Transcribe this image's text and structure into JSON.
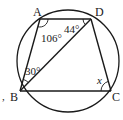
{
  "diagram": {
    "type": "cyclic-quadrilateral",
    "colors": {
      "stroke": "#1a1a1a",
      "background": "#ffffff"
    },
    "circle": {
      "cx": 68,
      "cy": 61,
      "r": 51
    },
    "vertices": {
      "A": {
        "label": "A",
        "x": 40,
        "y": 19
      },
      "B": {
        "label": "B",
        "x": 20,
        "y": 91
      },
      "C": {
        "label": "C",
        "x": 111,
        "y": 91
      },
      "D": {
        "label": "D",
        "x": 91,
        "y": 19
      }
    },
    "segments": [
      "AD",
      "AB",
      "BD",
      "DC",
      "BC"
    ],
    "angles": {
      "angle_A": {
        "vertex": "A",
        "between": [
          "AB",
          "AD"
        ],
        "label": "106°"
      },
      "angle_ADB": {
        "vertex": "D",
        "between": [
          "DA",
          "DB"
        ],
        "label": "44°"
      },
      "angle_ABD": {
        "vertex": "B",
        "between": [
          "BA",
          "BD"
        ],
        "label": "30°"
      },
      "angle_C": {
        "vertex": "C",
        "between": [
          "CB",
          "CD"
        ],
        "label": "x"
      }
    },
    "extra_marks": {
      "comma": ","
    }
  }
}
